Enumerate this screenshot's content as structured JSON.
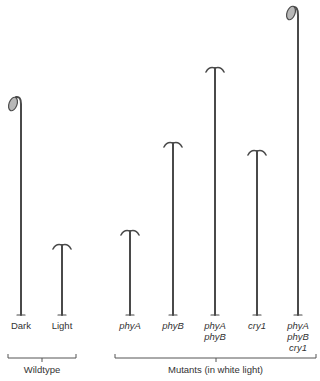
{
  "figure": {
    "type": "seedling height comparison diagram",
    "groups": [
      {
        "label": "Wildtype",
        "seedlings": [
          {
            "label": "Dark",
            "form": "hook-with-cotyledon",
            "relative_height": 0.74
          },
          {
            "label": "Light",
            "form": "open-cotyledons",
            "relative_height": 0.24
          }
        ]
      },
      {
        "label": "Mutants (in white light)",
        "seedlings": [
          {
            "label": "phyA",
            "lines": [
              "phyA"
            ],
            "form": "open-cotyledons",
            "relative_height": 0.28
          },
          {
            "label": "phyB",
            "lines": [
              "phyB"
            ],
            "form": "open-cotyledons",
            "relative_height": 0.57
          },
          {
            "label": "phyA phyB",
            "lines": [
              "phyA",
              "phyB"
            ],
            "form": "open-cotyledons",
            "relative_height": 0.83
          },
          {
            "label": "cry1",
            "lines": [
              "cry1"
            ],
            "form": "open-cotyledons",
            "relative_height": 0.54
          },
          {
            "label": "phyA phyB cry1",
            "lines": [
              "phyA",
              "phyB",
              "cry1"
            ],
            "form": "hook-with-cotyledon",
            "relative_height": 1.0
          }
        ]
      }
    ]
  },
  "labels": {
    "dark": "Dark",
    "light": "Light",
    "phyA": "phyA",
    "phyB": "phyB",
    "phyAphyB_1": "phyA",
    "phyAphyB_2": "phyB",
    "cry1": "cry1",
    "triple_1": "phyA",
    "triple_2": "phyB",
    "triple_3": "cry1",
    "wildtype": "Wildtype",
    "mutants": "Mutants (in white light)"
  },
  "colors": {
    "stem": "#4a4a4a",
    "cotyledon_fill": "#b8b8b8",
    "text": "#333333"
  }
}
